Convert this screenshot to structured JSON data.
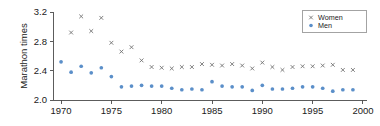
{
  "chart_data": {
    "type": "scatter",
    "title": "",
    "xlabel": "",
    "ylabel": "Marathon times",
    "xlim": [
      1969.2,
      2000.4
    ],
    "ylim": [
      2.0,
      3.2
    ],
    "xticks": [
      1970,
      1975,
      1980,
      1985,
      1990,
      1995,
      2000
    ],
    "xticklabels": [
      "1970",
      "1975",
      "1980",
      "1985",
      "1990",
      "1995",
      "2000"
    ],
    "yticks": [
      2.0,
      2.4,
      2.8,
      3.2
    ],
    "yticklabels": [
      "2.0",
      "2.4",
      "2.8",
      "3.2"
    ],
    "grid": false,
    "legend_position": "top-right",
    "x": [
      1970,
      1971,
      1972,
      1973,
      1974,
      1975,
      1976,
      1977,
      1978,
      1979,
      1980,
      1981,
      1982,
      1983,
      1984,
      1985,
      1986,
      1987,
      1988,
      1989,
      1990,
      1991,
      1992,
      1993,
      1994,
      1995,
      1996,
      1997,
      1998,
      1999
    ],
    "series": [
      {
        "name": "Women",
        "marker": "x",
        "color": "#6b6b6b",
        "values": [
          null,
          2.92,
          3.14,
          2.94,
          3.12,
          2.78,
          2.66,
          2.72,
          2.54,
          2.45,
          2.44,
          2.43,
          2.45,
          2.45,
          2.49,
          2.48,
          2.47,
          2.49,
          2.47,
          2.43,
          2.51,
          2.45,
          2.41,
          2.45,
          2.46,
          2.46,
          2.47,
          2.48,
          2.41,
          2.41
        ]
      },
      {
        "name": "Men",
        "marker": "o",
        "color": "#5b8fc9",
        "values": [
          2.52,
          2.38,
          2.46,
          2.37,
          2.44,
          2.32,
          2.18,
          2.19,
          2.2,
          2.19,
          2.19,
          2.16,
          2.14,
          2.15,
          2.14,
          2.25,
          2.19,
          2.18,
          2.18,
          2.13,
          2.2,
          2.15,
          2.15,
          2.16,
          2.18,
          2.18,
          2.16,
          2.12,
          2.14,
          2.14
        ]
      }
    ]
  },
  "legend": {
    "entries": [
      {
        "label": "Women",
        "marker": "x-marker-icon"
      },
      {
        "label": "Men",
        "marker": "dot-marker-icon"
      }
    ]
  }
}
